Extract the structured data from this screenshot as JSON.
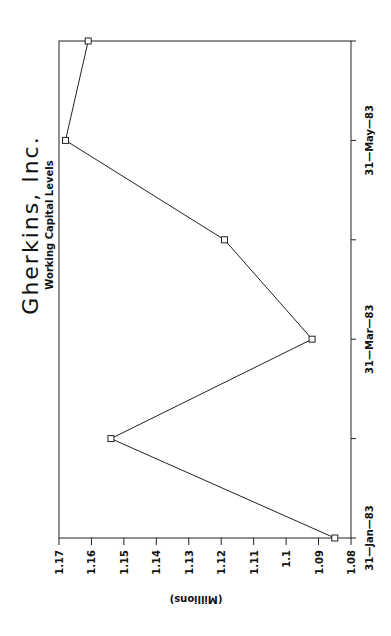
{
  "chart_data": {
    "type": "line",
    "title": "Gherkins, Inc.",
    "subtitle": "Working Capital Levels",
    "xlabel": "",
    "ylabel": "(Millions)",
    "orientation": "rotated-90-clockwise",
    "x": [
      "31-Jan-83",
      "28-Feb-83",
      "31-Mar-83",
      "30-Apr-83",
      "31-May-83",
      "30-Jun-83"
    ],
    "x_tick_labels": [
      "31-Jan-83",
      "31-Mar-83",
      "31-May-83"
    ],
    "series": [
      {
        "name": "Working Capital",
        "marker": "square",
        "values": [
          1.085,
          1.154,
          1.092,
          1.119,
          1.168,
          1.161
        ]
      }
    ],
    "y_ticks": [
      "1.08",
      "1.09",
      "1.1",
      "1.11",
      "1.12",
      "1.13",
      "1.14",
      "1.15",
      "1.16",
      "1.17"
    ],
    "ylim": [
      1.08,
      1.17
    ],
    "grid": false,
    "legend": "none"
  },
  "colors": {
    "line": "#222222",
    "background": "#ffffff"
  }
}
